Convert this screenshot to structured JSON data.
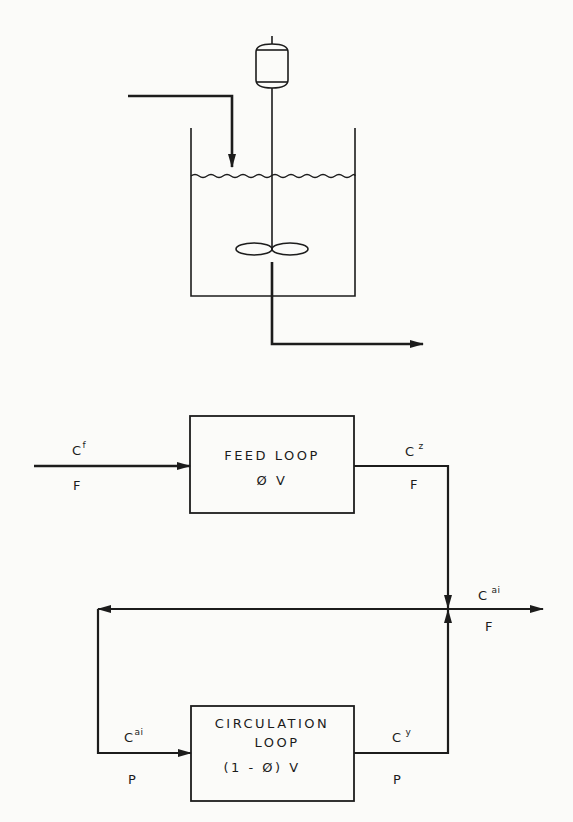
{
  "reactor": {
    "description": "Stirred tank with agitator motor, impeller, feed inlet and outlet",
    "motor_icon": "motor-icon",
    "impeller_icon": "impeller-icon"
  },
  "feed_loop": {
    "title": "FEED LOOP",
    "volume": "Ø V"
  },
  "circulation_loop": {
    "title_line1": "CIRCULATION",
    "title_line2": "LOOP",
    "volume": "(1 - Ø) V"
  },
  "streams": {
    "feed_in": {
      "conc": "C",
      "conc_sup": "f",
      "flow": "F"
    },
    "feed_out": {
      "conc": "C",
      "conc_sup": "z",
      "flow": "F"
    },
    "product_out": {
      "conc": "C",
      "conc_sup": "ai",
      "flow": "F"
    },
    "circ_in": {
      "conc": "C",
      "conc_sup": "ai",
      "flow": "P"
    },
    "circ_out": {
      "conc": "C",
      "conc_sup": "y",
      "flow": "P"
    }
  },
  "colors": {
    "line": "#1c1c1c",
    "background": "#fbfbf9"
  }
}
